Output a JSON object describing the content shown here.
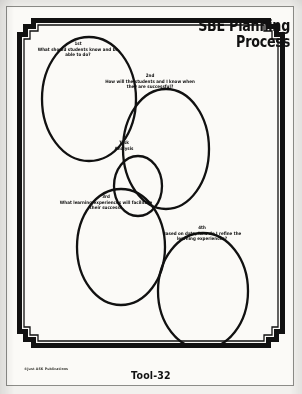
{
  "document": {
    "title_line1": "SBE Planning",
    "title_line2": "Process",
    "tool_label": "Tool-32",
    "copyright": "©Just ASK Publications"
  },
  "diagram": {
    "type": "overlapping-ellipses-cycle",
    "nodes": [
      {
        "id": "step-1",
        "ordinal": "1st",
        "question": "What should students know and be able to do?"
      },
      {
        "id": "step-2",
        "ordinal": "2nd",
        "question": "How will the students and I know when they are successful?"
      },
      {
        "id": "task-analysis",
        "ordinal": "Task",
        "question": "Analysis"
      },
      {
        "id": "step-3",
        "ordinal": "3rd",
        "question": "What learning experiences will facilitate their success?"
      },
      {
        "id": "step-4",
        "ordinal": "4th",
        "question": "Based on data, how do I refine the learning experiences?"
      }
    ]
  },
  "colors": {
    "ink": "#111111",
    "paper": "#fbfaf7",
    "page_background": "#f2f1ee",
    "outer_background": "#b9b9b7"
  }
}
